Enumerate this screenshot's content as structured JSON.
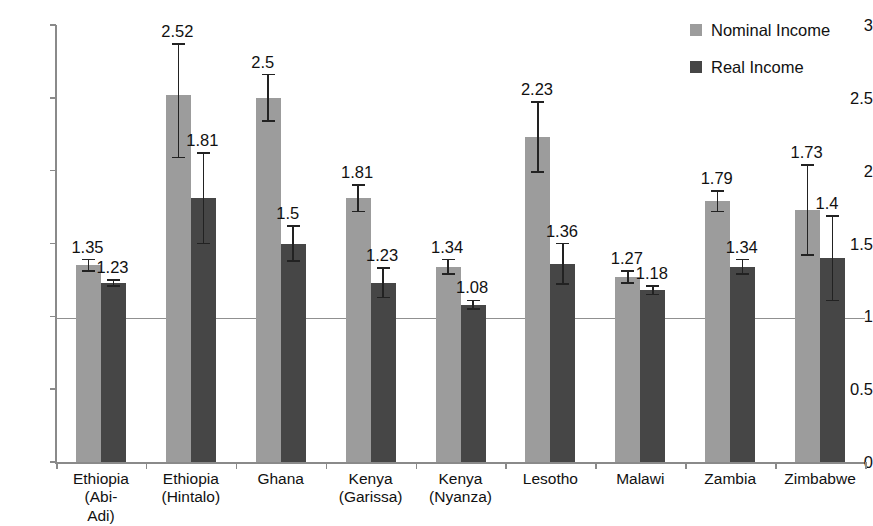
{
  "chart_data": {
    "type": "bar",
    "title": "",
    "xlabel": "",
    "ylabel": "",
    "ylim": [
      0,
      3
    ],
    "ytick_labels": [
      "0",
      "0.5",
      "1",
      "1.5",
      "2",
      "2.5",
      "3"
    ],
    "ytick_values": [
      0,
      0.5,
      1,
      1.5,
      2,
      2.5,
      3
    ],
    "grid": false,
    "legend_position": "top-right",
    "reference_line": 1,
    "categories": [
      "Ethiopia (Abi-\nAdi)",
      "Ethiopia\n(Hintalo)",
      "Ghana",
      "Kenya\n(Garissa)",
      "Kenya\n(Nyanza)",
      "Lesotho",
      "Malawi",
      "Zambia",
      "Zimbabwe"
    ],
    "series": [
      {
        "name": "Nominal Income",
        "color": "#9c9c9c",
        "values": [
          1.35,
          2.52,
          2.5,
          1.81,
          1.34,
          2.23,
          1.27,
          1.79,
          1.73
        ],
        "labels": [
          "1.35",
          "2.52",
          "2.5",
          "1.81",
          "1.34",
          "2.23",
          "1.27",
          "1.79",
          "1.73"
        ],
        "err_low": [
          0.04,
          0.43,
          0.16,
          0.09,
          0.05,
          0.24,
          0.04,
          0.07,
          0.31
        ],
        "err_high": [
          0.04,
          0.35,
          0.16,
          0.09,
          0.05,
          0.24,
          0.04,
          0.07,
          0.31
        ]
      },
      {
        "name": "Real Income",
        "color": "#464646",
        "values": [
          1.23,
          1.81,
          1.5,
          1.23,
          1.08,
          1.36,
          1.18,
          1.34,
          1.4
        ],
        "labels": [
          "1.23",
          "1.81",
          "1.5",
          "1.23",
          "1.08",
          "1.36",
          "1.18",
          "1.34",
          "1.4"
        ],
        "err_low": [
          0.02,
          0.31,
          0.12,
          0.1,
          0.03,
          0.14,
          0.03,
          0.05,
          0.29
        ],
        "err_high": [
          0.02,
          0.31,
          0.12,
          0.1,
          0.03,
          0.14,
          0.03,
          0.05,
          0.29
        ]
      }
    ]
  },
  "legend": {
    "items": [
      {
        "label": "Nominal Income",
        "swatch": "nominal"
      },
      {
        "label": "Real Income",
        "swatch": "real"
      }
    ]
  }
}
